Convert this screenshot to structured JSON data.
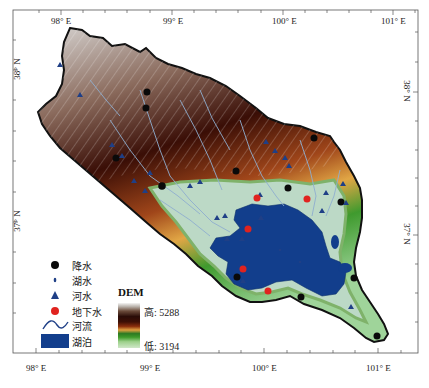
{
  "map": {
    "longitude_ticks_top": [
      "98° E",
      "99° E",
      "100° E",
      "101° E"
    ],
    "longitude_ticks_bottom": [
      "98° E",
      "99° E",
      "100° E",
      "101° E"
    ],
    "latitude_ticks_left": [
      "38° N",
      "37° N"
    ],
    "latitude_ticks_right": [
      "38° N",
      "37° N"
    ]
  },
  "legend": {
    "items": [
      {
        "symbol": "black-dot",
        "label": "降水"
      },
      {
        "symbol": "small-diamond",
        "label": "湖水"
      },
      {
        "symbol": "blue-triangle",
        "label": "河水"
      },
      {
        "symbol": "red-dot",
        "label": "地下水"
      },
      {
        "symbol": "river-line",
        "label": "河流"
      },
      {
        "symbol": "lake-rect",
        "label": "湖泊"
      }
    ],
    "dem": {
      "title": "DEM",
      "high_label": "高",
      "high_value": "5288",
      "low_label": "低",
      "low_value": "3194"
    }
  },
  "colors": {
    "lake": "#123e8c",
    "precip_marker": "#0a0a0a",
    "river_marker": "#1f3f86",
    "groundwater_marker": "#e0231f",
    "lowland": "#bcd9c6",
    "mountain_dark": "#3a0e06"
  }
}
